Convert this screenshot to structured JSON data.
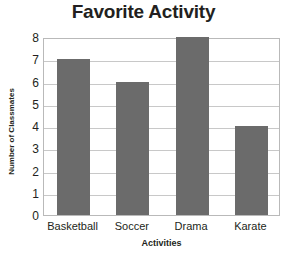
{
  "chart_data": {
    "type": "bar",
    "title": "Favorite Activity",
    "xlabel": "Activities",
    "ylabel": "Number of Classmates",
    "categories": [
      "Basketball",
      "Soccer",
      "Drama",
      "Karate"
    ],
    "values": [
      7,
      6,
      8,
      4
    ],
    "ylim": [
      0,
      8
    ],
    "ytick_step": 1,
    "yticks": [
      0,
      1,
      2,
      3,
      4,
      5,
      6,
      7,
      8
    ],
    "grid": true,
    "legend": "none",
    "bar_color": "#6b6b6b",
    "gridline_color": "#c8c8c8",
    "plot_border_color": "#b9b9b9",
    "background_color": "#ffffff",
    "text_color": "#231f20"
  }
}
